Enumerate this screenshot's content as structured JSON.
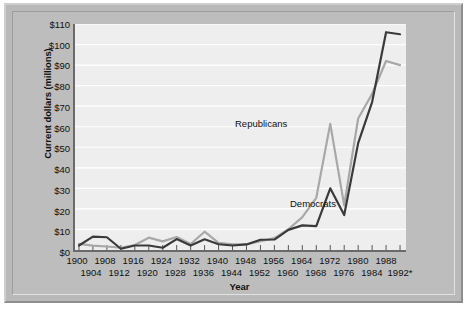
{
  "chart_data": {
    "type": "line",
    "title": "",
    "xlabel": "Year",
    "ylabel": "Current dollars (millions)",
    "xlim": [
      1900,
      1992
    ],
    "ylim": [
      0,
      110
    ],
    "grid": true,
    "legend_position": "inline-annotation",
    "y_ticks": [
      0,
      10,
      20,
      30,
      40,
      50,
      60,
      70,
      80,
      90,
      100,
      110
    ],
    "y_tick_labels": [
      "$0",
      "$10",
      "$20",
      "$30",
      "$40",
      "$50",
      "$60",
      "$70",
      "$80",
      "$90",
      "$100",
      "$110"
    ],
    "x_ticks": [
      1900,
      1904,
      1908,
      1912,
      1916,
      1920,
      1924,
      1928,
      1932,
      1936,
      1940,
      1944,
      1948,
      1952,
      1956,
      1960,
      1964,
      1968,
      1972,
      1976,
      1980,
      1984,
      1988,
      1992
    ],
    "x_tick_labels_top": [
      "1900",
      "1908",
      "1916",
      "1924",
      "1932",
      "1940",
      "1948",
      "1956",
      "1964",
      "1972",
      "1980",
      "1988"
    ],
    "x_tick_labels_bottom": [
      "1904",
      "1912",
      "1920",
      "1928",
      "1936",
      "1944",
      "1952",
      "1960",
      "1968",
      "1976",
      "1984",
      "1992*"
    ],
    "x": [
      1900,
      1904,
      1908,
      1912,
      1916,
      1920,
      1924,
      1928,
      1932,
      1936,
      1940,
      1944,
      1948,
      1952,
      1956,
      1960,
      1964,
      1968,
      1972,
      1976,
      1980,
      1984,
      1988,
      1992
    ],
    "series": [
      {
        "name": "Republicans",
        "color": "#a8a8a8",
        "values": [
          3.0,
          2.1,
          1.7,
          1.1,
          2.4,
          6.0,
          4.2,
          6.3,
          2.9,
          8.9,
          3.5,
          2.8,
          2.7,
          4.3,
          5.8,
          10.1,
          16.0,
          25.4,
          61.4,
          21.8,
          64.0,
          76.0,
          92.0,
          90.0
        ]
      },
      {
        "name": "Democrats",
        "color": "#3a3a3a",
        "values": [
          2.2,
          6.5,
          6.2,
          0.6,
          2.2,
          2.2,
          1.1,
          5.3,
          2.2,
          5.2,
          2.8,
          2.2,
          2.7,
          5.0,
          5.1,
          9.8,
          12.0,
          11.6,
          30.0,
          17.0,
          52.0,
          72.0,
          106.0,
          105.0
        ]
      }
    ],
    "annotations": [
      {
        "text": "Republicans",
        "series": "Republicans"
      },
      {
        "text": "Democrats",
        "series": "Democrats"
      }
    ]
  }
}
